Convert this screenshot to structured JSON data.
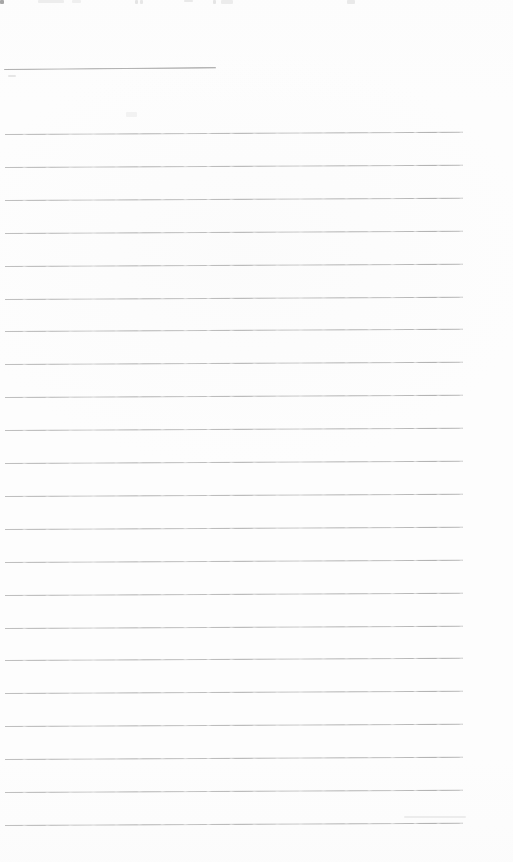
{
  "page": {
    "width": 513,
    "height": 862,
    "background_color": "#fdfdfd",
    "content_text": "",
    "name_line": {
      "x": 4,
      "y": 69,
      "width": 212,
      "skew_deg": -0.5,
      "color": "#9e9e9e"
    },
    "ruled_lines": {
      "count": 22,
      "x": 5,
      "width": 458,
      "first_y": 134,
      "spacing": 32.9,
      "skew_deg": -0.28,
      "color": "#b5b5b5"
    },
    "artifacts": [
      {
        "x": 0,
        "y": 0,
        "w": 4,
        "h": 4,
        "color": "#a6a6a6"
      },
      {
        "x": 38,
        "y": 0,
        "w": 26,
        "h": 3,
        "color": "#ededed"
      },
      {
        "x": 72,
        "y": 0,
        "w": 9,
        "h": 3,
        "color": "#efefef"
      },
      {
        "x": 135,
        "y": 0,
        "w": 3,
        "h": 4,
        "color": "#e4e4e4"
      },
      {
        "x": 140,
        "y": 0,
        "w": 3,
        "h": 4,
        "color": "#e7e7e7"
      },
      {
        "x": 184,
        "y": 0,
        "w": 9,
        "h": 2,
        "color": "#e9e9e9"
      },
      {
        "x": 213,
        "y": 0,
        "w": 3,
        "h": 4,
        "color": "#e5e5e5"
      },
      {
        "x": 221,
        "y": 0,
        "w": 12,
        "h": 4,
        "color": "#ececec"
      },
      {
        "x": 347,
        "y": 0,
        "w": 8,
        "h": 4,
        "color": "#e9e9e9"
      },
      {
        "x": 8,
        "y": 75,
        "w": 8,
        "h": 2,
        "color": "#e6e6e6"
      },
      {
        "x": 126,
        "y": 112,
        "w": 11,
        "h": 5,
        "color": "#f2f2f2"
      },
      {
        "x": 404,
        "y": 816,
        "w": 62,
        "h": 2,
        "color": "#ececec"
      }
    ]
  }
}
